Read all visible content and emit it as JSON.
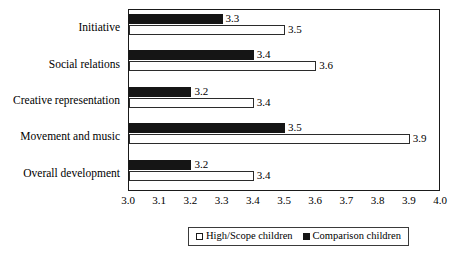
{
  "chart_data": {
    "type": "bar",
    "orientation": "horizontal",
    "title": "",
    "subtitle": "",
    "xlabel": "",
    "ylabel": "",
    "xlim": [
      3.0,
      4.0
    ],
    "xticks": [
      "3.0",
      "3.1",
      "3.2",
      "3.3",
      "3.4",
      "3.5",
      "3.6",
      "3.7",
      "3.8",
      "3.9",
      "4.0"
    ],
    "xtick_step": 0.1,
    "grid": false,
    "frame": true,
    "legend_position": "bottom-center",
    "categories": [
      "Initiative",
      "Social relations",
      "Creative representation",
      "Movement and music",
      "Overall development"
    ],
    "series": [
      {
        "name": "Comparison children",
        "swatch": "filled",
        "color": "#151515",
        "values": [
          3.3,
          3.4,
          3.2,
          3.5,
          3.2
        ],
        "labels": [
          "3.3",
          "3.4",
          "3.2",
          "3.5",
          "3.2"
        ]
      },
      {
        "name": "High/Scope children",
        "swatch": "hollow",
        "color": "#ffffff",
        "values": [
          3.5,
          3.6,
          3.4,
          3.9,
          3.4
        ],
        "labels": [
          "3.5",
          "3.6",
          "3.4",
          "3.9",
          "3.4"
        ]
      }
    ]
  },
  "legend": {
    "entries": [
      {
        "label": "High/Scope children",
        "swatch": "hollow"
      },
      {
        "label": "Comparison children",
        "swatch": "filled"
      }
    ]
  },
  "colors": {
    "comparison_fill": "#151515",
    "highscope_fill": "#ffffff",
    "outline": "#1a1a1a",
    "background": "#ffffff"
  }
}
